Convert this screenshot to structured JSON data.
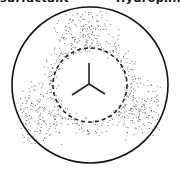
{
  "caption": {
    "left_text": "surfactant",
    "right_text": "Hydrophilic"
  },
  "diagram": {
    "outer_circle": {
      "cx": 90,
      "cy": 85,
      "r": 78,
      "stroke": "#111111"
    },
    "stipple_cloud": {
      "color": "#555555",
      "lobes": [
        {
          "cx": 86,
          "cy": 36
        },
        {
          "cx": 42,
          "cy": 112
        },
        {
          "cx": 134,
          "cy": 108
        }
      ]
    },
    "dashed_circle": {
      "cx": 90,
      "cy": 85,
      "r": 37,
      "stroke": "#222222"
    },
    "center_symbol": {
      "name": "three-arm-junction",
      "junction": [
        89,
        84
      ],
      "arms": [
        [
          89,
          63
        ],
        [
          72,
          95
        ],
        [
          105,
          94
        ]
      ],
      "stroke": "#222222"
    }
  }
}
